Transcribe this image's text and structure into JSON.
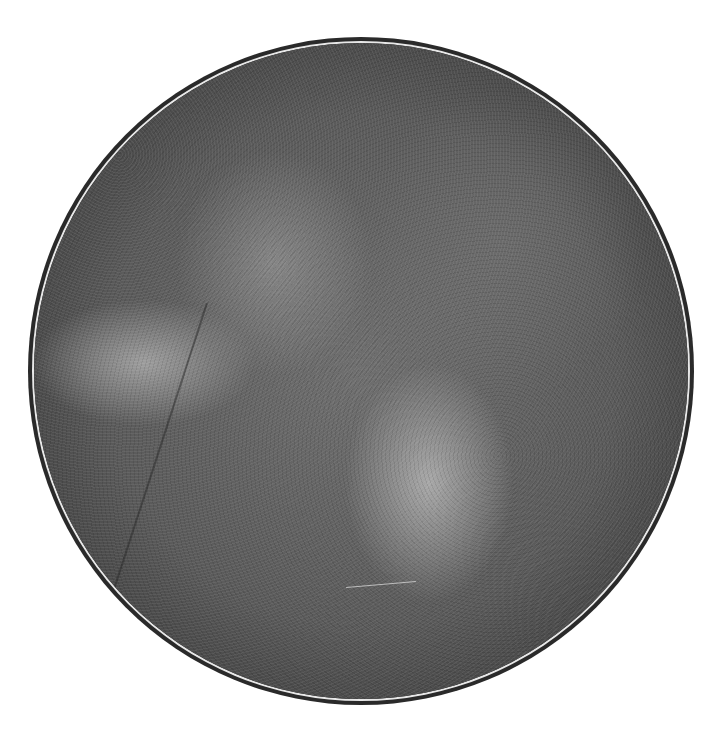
{
  "image": {
    "description": "circular grayscale grainy field of view",
    "colors": {
      "background": "#ffffff",
      "outer_ring": "#2a2a2a",
      "inner_ring": "#e8e8e8",
      "field_mid": "#6e6e6e"
    }
  }
}
